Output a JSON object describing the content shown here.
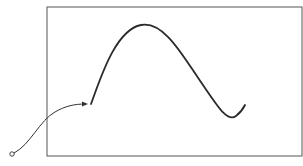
{
  "diagram": {
    "frame": {
      "x": 47,
      "y": 7,
      "width": 255,
      "height": 149,
      "stroke": "#555555"
    },
    "curve": {
      "path": "M91,104 C100,80 115,30 141,25 C165,20 185,60 205,88 C220,110 228,122 236,116 C240,113 243,109 245,105",
      "stroke": "#2a2a2a",
      "width": 1.8
    },
    "connector": {
      "path": "M14,153 C30,145 40,120 55,112 C65,106 75,104 85,104",
      "stroke": "#333333",
      "width": 1,
      "arrow_tip": [
        88,
        104
      ]
    },
    "origin_marker": {
      "cx": 12,
      "cy": 154,
      "r": 2.2,
      "stroke": "#444444"
    }
  }
}
